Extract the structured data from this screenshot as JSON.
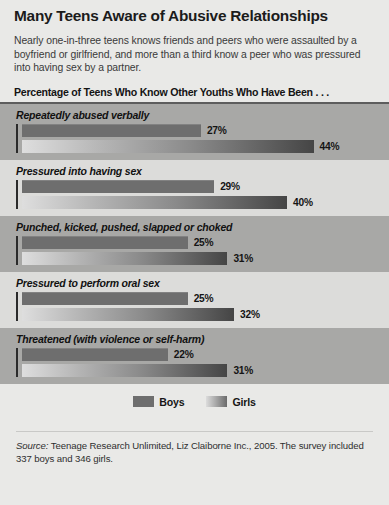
{
  "title": "Many Teens Aware of Abusive Relationships",
  "subtitle": "Nearly one-in-three teens knows friends and peers who were assaulted by a boyfriend or girlfriend, and more than a third know a peer who was pressured into having sex by a partner.",
  "section_heading": "Percentage of Teens Who Know Other Youths Who Have Been . . .",
  "legend": {
    "boys_label": "Boys",
    "girls_label": "Girls"
  },
  "footnote": {
    "source_word": "Source:",
    "text": " Teenage Research Unlimited, Liz Claiborne Inc., 2005. The survey included 337 boys and 346 girls."
  },
  "colors": {
    "background": "#e9e9e7",
    "band_dark": "#a8a8a6",
    "band_light": "#dcdcda",
    "boys_bar": "#6e6e6e",
    "girls_bar_start": "#dedede",
    "girls_bar_end": "#454545",
    "axis": "#2b2b2b",
    "rule": "#5d5d5d"
  },
  "chart_data": {
    "type": "bar",
    "title": "Many Teens Aware of Abusive Relationships",
    "subtitle": "Percentage of Teens Who Know Other Youths Who Have Been . . .",
    "xlabel": "",
    "ylabel": "",
    "xlim": [
      0,
      48
    ],
    "grid": false,
    "orientation": "horizontal",
    "legend_position": "bottom-center",
    "value_suffix": "%",
    "categories": [
      "Repeatedly abused verbally",
      "Pressured into having sex",
      "Punched, kicked, pushed, slapped or choked",
      "Pressured to perform oral sex",
      "Threatened (with violence or self-harm)"
    ],
    "series": [
      {
        "name": "Boys",
        "values": [
          27,
          29,
          25,
          25,
          22
        ],
        "labels": [
          "27%",
          "29%",
          "25%",
          "25%",
          "22%"
        ]
      },
      {
        "name": "Girls",
        "values": [
          44,
          40,
          31,
          32,
          31
        ],
        "labels": [
          "44%",
          "40%",
          "31%",
          "32%",
          "31%"
        ]
      }
    ]
  }
}
